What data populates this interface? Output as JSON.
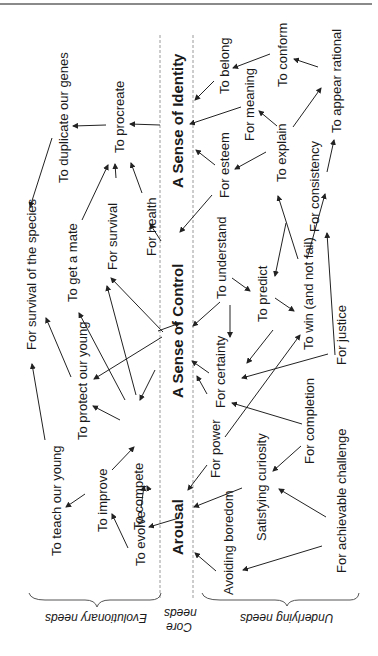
{
  "diagram": {
    "core_needs": [
      {
        "id": "identity",
        "label": "A Sense of Identity",
        "x": 177,
        "y": 190
      },
      {
        "id": "control",
        "label": "A Sense of Control",
        "x": 177,
        "y": 400
      },
      {
        "id": "arousal",
        "label": "Arousal",
        "x": 177,
        "y": 555
      }
    ],
    "evolutionary_needs": [
      {
        "id": "duplicate",
        "label": "To duplicate our genes",
        "x": 58,
        "y": 185
      },
      {
        "id": "procreate",
        "label": "To procreate",
        "x": 113,
        "y": 155
      },
      {
        "id": "survival_species",
        "label": "For survival of the species",
        "x": 25,
        "y": 350
      },
      {
        "id": "get_mate",
        "label": "To get a mate",
        "x": 67,
        "y": 302
      },
      {
        "id": "survival",
        "label": "For survival",
        "x": 107,
        "y": 272
      },
      {
        "id": "health",
        "label": "For health",
        "x": 145,
        "y": 256
      },
      {
        "id": "protect",
        "label": "To protect our young",
        "x": 77,
        "y": 440
      },
      {
        "id": "teach",
        "label": "To teach our young",
        "x": 50,
        "y": 555
      },
      {
        "id": "compete",
        "label": "To compete",
        "x": 134,
        "y": 530
      },
      {
        "id": "improve",
        "label": "To improve",
        "x": 97,
        "y": 535
      },
      {
        "id": "evolve",
        "label": "To evolve",
        "x": 134,
        "y": 565
      }
    ],
    "underlying_needs": [
      {
        "id": "belong",
        "label": "To belong",
        "x": 30,
        "y": 30,
        "abs": true
      },
      {
        "id": "meaning",
        "label": "For meaning",
        "x": 0,
        "y": 0
      },
      {
        "id": "conform",
        "label": "To conform",
        "x": 0,
        "y": 0
      },
      {
        "id": "appear_rational",
        "label": "To appear rational",
        "x": 0,
        "y": 0
      },
      {
        "id": "explain",
        "label": "To explain",
        "x": 0,
        "y": 0
      },
      {
        "id": "esteem",
        "label": "For esteem",
        "x": 0,
        "y": 0
      },
      {
        "id": "consistency",
        "label": "For consistency",
        "x": 0,
        "y": 0
      },
      {
        "id": "understand",
        "label": "To understand",
        "x": 0,
        "y": 0
      },
      {
        "id": "predict",
        "label": "To predict",
        "x": 0,
        "y": 0
      },
      {
        "id": "win",
        "label": "To win (and not fail)",
        "x": 0,
        "y": 0
      },
      {
        "id": "certainty",
        "label": "For certainty",
        "x": 0,
        "y": 0
      },
      {
        "id": "justice",
        "label": "For justice",
        "x": 0,
        "y": 0
      },
      {
        "id": "power",
        "label": "For power",
        "x": 0,
        "y": 0
      },
      {
        "id": "completion",
        "label": "For completion",
        "x": 0,
        "y": 0
      },
      {
        "id": "curiosity",
        "label": "Satisfying curiosity",
        "x": 0,
        "y": 0
      },
      {
        "id": "challenge",
        "label": "For achievable challenge",
        "x": 0,
        "y": 0
      },
      {
        "id": "boredom",
        "label": "Avoiding boredom",
        "x": 0,
        "y": 0
      }
    ],
    "groups": {
      "evolutionary": "Evolutionary needs",
      "core_line1": "Core",
      "core_line2": "needs",
      "underlying": "Underlying needs"
    }
  }
}
